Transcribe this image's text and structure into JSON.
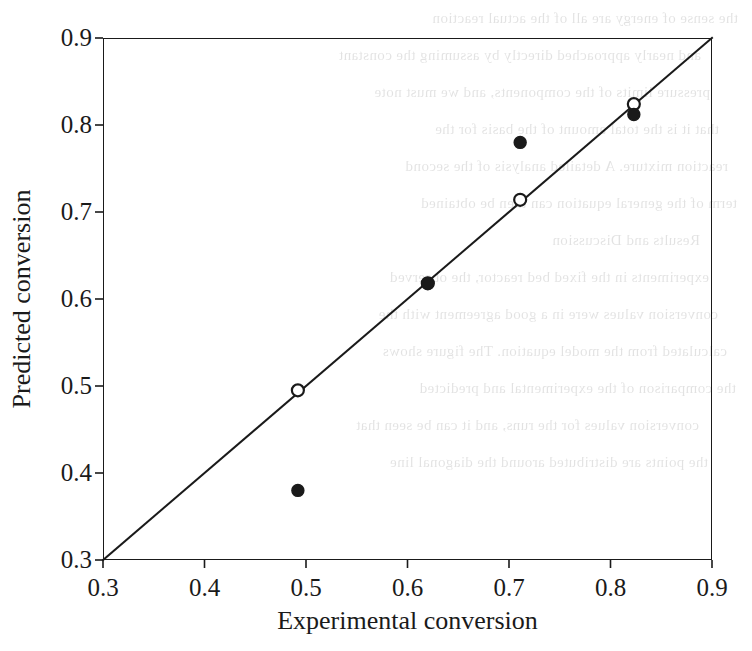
{
  "figure": {
    "background_color": "#ffffff",
    "ink_color": "#1a1a1a",
    "scan_artifact": "faint mirrored bleed-through text from reverse side of scanned page"
  },
  "bleed_through_text": [
    "the sense of energy are all of the actual reaction",
    "and nearly approached directly by assuming the constant",
    "pressure limits of the components, and we must note",
    "that it is the total amount of the basis for the",
    "reaction mixture. A detailed analysis of the second",
    "term of the general equation can then be obtained",
    "Results and Discussion",
    "experiments in the fixed bed reactor, the observed",
    "conversion values were in a good agreement with the",
    "calculated from the model equation. The figure shows",
    "the comparison of the experimental and predicted",
    "conversion values for the runs, and it can be seen that",
    "the points are distributed around the diagonal line"
  ],
  "chart_data": {
    "type": "scatter",
    "title": "",
    "xlabel": "Experimental conversion",
    "ylabel": "Predicted  conversion",
    "xlim": [
      0.3,
      0.9
    ],
    "ylim": [
      0.3,
      0.9
    ],
    "xticks": [
      0.3,
      0.4,
      0.5,
      0.6,
      0.7,
      0.8,
      0.9
    ],
    "yticks": [
      0.3,
      0.4,
      0.5,
      0.6,
      0.7,
      0.8,
      0.9
    ],
    "xtick_labels": [
      "0.3",
      "0.4",
      "0.5",
      "0.6",
      "0.7",
      "0.8",
      "0.9"
    ],
    "ytick_labels": [
      "0.3",
      "0.4",
      "0.5",
      "0.6",
      "0.7",
      "0.8",
      "0.9"
    ],
    "grid": false,
    "legend": null,
    "reference_line": {
      "name": "parity-line",
      "equation": "y = x",
      "from": [
        0.3,
        0.3
      ],
      "to": [
        0.9,
        0.9
      ],
      "color": "#1a1a1a",
      "width_px": 2
    },
    "series": [
      {
        "name": "Open circles",
        "marker": "open-circle",
        "color": "#1a1a1a",
        "fill": "none",
        "radius_px": 6,
        "points": [
          {
            "x": 0.492,
            "y": 0.495
          },
          {
            "x": 0.62,
            "y": 0.618
          },
          {
            "x": 0.711,
            "y": 0.714
          },
          {
            "x": 0.823,
            "y": 0.824
          }
        ]
      },
      {
        "name": "Filled circles",
        "marker": "filled-circle",
        "color": "#1a1a1a",
        "fill": "#1a1a1a",
        "radius_px": 6,
        "points": [
          {
            "x": 0.492,
            "y": 0.38
          },
          {
            "x": 0.62,
            "y": 0.618
          },
          {
            "x": 0.711,
            "y": 0.78
          },
          {
            "x": 0.823,
            "y": 0.812
          }
        ]
      }
    ]
  }
}
